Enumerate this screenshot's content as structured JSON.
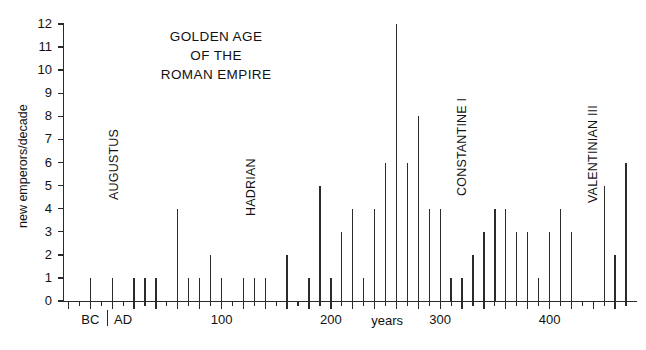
{
  "chart_data": {
    "type": "bar",
    "title": "GOLDEN AGE OF THE ROMAN EMPIRE",
    "title_lines": [
      "GOLDEN AGE",
      "OF THE",
      "ROMAN EMPIRE"
    ],
    "xlabel": "years",
    "ylabel": "new emperors/decade",
    "xlim": [
      -45,
      480
    ],
    "ylim": [
      0,
      12
    ],
    "ytick_labels": [
      "0",
      "1",
      "2",
      "3",
      "4",
      "5",
      "6",
      "7",
      "8",
      "9",
      "10",
      "11",
      "12"
    ],
    "ytick_values": [
      0,
      1,
      2,
      3,
      4,
      5,
      6,
      7,
      8,
      9,
      10,
      11,
      12
    ],
    "xtick_labels": [
      "BC",
      "AD",
      "100",
      "200",
      "300",
      "400"
    ],
    "xtick_label_values": [
      -20,
      10,
      100,
      200,
      300,
      400
    ],
    "xtick_major_values": [
      -40,
      -20,
      0,
      20,
      40,
      60,
      80,
      100,
      120,
      140,
      160,
      180,
      200,
      220,
      240,
      260,
      280,
      300,
      320,
      340,
      360,
      380,
      400,
      420,
      440,
      460
    ],
    "grid": false,
    "legend": null,
    "bar_width_years": 2,
    "categories": [
      -30,
      -20,
      -10,
      0,
      10,
      20,
      30,
      40,
      50,
      60,
      70,
      80,
      90,
      100,
      110,
      120,
      130,
      140,
      150,
      160,
      170,
      180,
      190,
      200,
      210,
      220,
      230,
      240,
      250,
      260,
      270,
      280,
      290,
      300,
      310,
      320,
      330,
      340,
      350,
      360,
      370,
      380,
      390,
      400,
      410,
      420,
      430,
      440,
      450,
      460
    ],
    "values": [
      0,
      1,
      0,
      1,
      0,
      1,
      1,
      1,
      0,
      4,
      1,
      1,
      2,
      1,
      0,
      1,
      1,
      1,
      0,
      2,
      0,
      1,
      5,
      1,
      3,
      4,
      1,
      4,
      6,
      12,
      6,
      8,
      4,
      4,
      1,
      1,
      2,
      3,
      4,
      4,
      3,
      3,
      1,
      3,
      4,
      3,
      0,
      0,
      5,
      2
    ],
    "series": [
      {
        "name": "new emperors per decade",
        "points": [
          {
            "year": -20,
            "value": 1
          },
          {
            "year": 0,
            "value": 1
          },
          {
            "year": 20,
            "value": 1
          },
          {
            "year": 30,
            "value": 1
          },
          {
            "year": 40,
            "value": 1
          },
          {
            "year": 60,
            "value": 4
          },
          {
            "year": 70,
            "value": 1
          },
          {
            "year": 80,
            "value": 1
          },
          {
            "year": 90,
            "value": 2
          },
          {
            "year": 100,
            "value": 1
          },
          {
            "year": 120,
            "value": 1
          },
          {
            "year": 130,
            "value": 1
          },
          {
            "year": 140,
            "value": 1
          },
          {
            "year": 160,
            "value": 2
          },
          {
            "year": 180,
            "value": 1
          },
          {
            "year": 190,
            "value": 5
          },
          {
            "year": 200,
            "value": 1
          },
          {
            "year": 210,
            "value": 3
          },
          {
            "year": 220,
            "value": 4
          },
          {
            "year": 230,
            "value": 1
          },
          {
            "year": 240,
            "value": 4
          },
          {
            "year": 250,
            "value": 6
          },
          {
            "year": 260,
            "value": 12
          },
          {
            "year": 270,
            "value": 6
          },
          {
            "year": 280,
            "value": 8
          },
          {
            "year": 290,
            "value": 4
          },
          {
            "year": 300,
            "value": 4
          },
          {
            "year": 310,
            "value": 1
          },
          {
            "year": 320,
            "value": 1
          },
          {
            "year": 330,
            "value": 2
          },
          {
            "year": 340,
            "value": 3
          },
          {
            "year": 350,
            "value": 4
          },
          {
            "year": 360,
            "value": 4
          },
          {
            "year": 370,
            "value": 3
          },
          {
            "year": 380,
            "value": 3
          },
          {
            "year": 390,
            "value": 1
          },
          {
            "year": 400,
            "value": 3
          },
          {
            "year": 410,
            "value": 4
          },
          {
            "year": 420,
            "value": 3
          },
          {
            "year": 450,
            "value": 5
          },
          {
            "year": 460,
            "value": 2
          },
          {
            "year": 470,
            "value": 6
          }
        ]
      }
    ],
    "annotations": [
      {
        "label": "AUGUSTUS",
        "year": -8,
        "orientation": "vertical"
      },
      {
        "label": "HADRIAN",
        "year": 117,
        "orientation": "vertical"
      },
      {
        "label": "CONSTANTINE I",
        "year": 310,
        "orientation": "vertical"
      },
      {
        "label": "VALENTINIAN III",
        "year": 430,
        "orientation": "vertical"
      }
    ],
    "line_color": "#2b2b2b",
    "axis_color": "#2a2a2a",
    "background": "#ffffff"
  }
}
